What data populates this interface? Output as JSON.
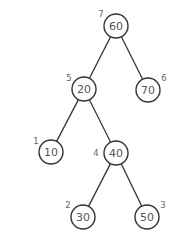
{
  "diagram": {
    "type": "binary-tree",
    "nodes": [
      {
        "id": "n60",
        "value": "60",
        "order": "7"
      },
      {
        "id": "n20",
        "value": "20",
        "order": "5"
      },
      {
        "id": "n70",
        "value": "70",
        "order": "6"
      },
      {
        "id": "n10",
        "value": "10",
        "order": "1"
      },
      {
        "id": "n40",
        "value": "40",
        "order": "4"
      },
      {
        "id": "n30",
        "value": "30",
        "order": "2"
      },
      {
        "id": "n50",
        "value": "50",
        "order": "3"
      }
    ],
    "edges": [
      {
        "from": "n60",
        "to": "n20"
      },
      {
        "from": "n60",
        "to": "n70"
      },
      {
        "from": "n20",
        "to": "n10"
      },
      {
        "from": "n20",
        "to": "n40"
      },
      {
        "from": "n40",
        "to": "n30"
      },
      {
        "from": "n40",
        "to": "n50"
      }
    ],
    "colors": {
      "stroke": "#333333",
      "text": "#555555"
    }
  }
}
